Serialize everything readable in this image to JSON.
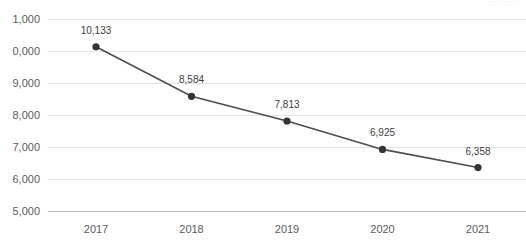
{
  "corner": {
    "artifact_text": "— —— ·"
  },
  "chart_data": {
    "type": "line",
    "title": "",
    "subtitle": "",
    "xlabel": "",
    "ylabel": "",
    "categories": [
      "2017",
      "2018",
      "2019",
      "2020",
      "2021"
    ],
    "values": [
      10133,
      8584,
      7813,
      6925,
      6358
    ],
    "point_labels": [
      "10,133",
      "8,584",
      "7,813",
      "6,925",
      "6,358"
    ],
    "series": [
      {
        "name": "",
        "values": [
          10133,
          8584,
          7813,
          6925,
          6358
        ],
        "color": "#4d4d4d",
        "marker_color": "#333333"
      }
    ],
    "ylim": [
      5000,
      11000
    ],
    "yticks": [
      11000,
      10000,
      9000,
      8000,
      7000,
      6000,
      5000
    ],
    "ytick_labels": [
      "11,000",
      "10,000",
      "9,000",
      "8,000",
      "7,000",
      "6,000",
      "5,000"
    ],
    "ytick_labels_visible": [
      "1,000",
      "0,000",
      "9,000",
      "8,000",
      "7,000",
      "6,000",
      "5,000"
    ],
    "grid": true,
    "legend": false,
    "legend_position": "none",
    "gridline_color": "#e4e4e4",
    "baseline_color": "#b9b9b9",
    "label_color": "#5b5b5b",
    "background": "#ffffff"
  }
}
